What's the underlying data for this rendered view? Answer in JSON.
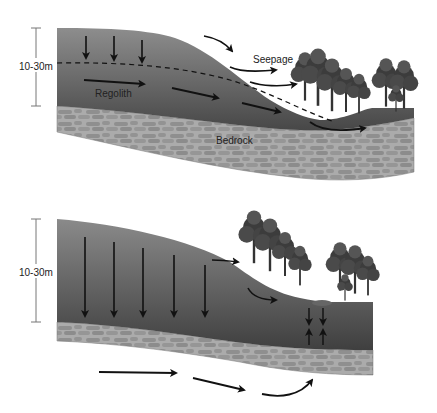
{
  "diagram": {
    "top_panel": {
      "depth_label": "10-30m",
      "labels": {
        "regolith": "Regolith",
        "seepage": "Seepage",
        "bedrock": "Bedrock"
      }
    },
    "bottom_panel": {
      "depth_label": "10-30m"
    },
    "colors": {
      "soil_top": "#8a8a8a",
      "soil_bottom": "#4a4a4a",
      "bedrock": "#a8a8a8",
      "stone": "#8e8e8e",
      "arrow": "#111111",
      "tree": "#3a3a3a"
    }
  }
}
